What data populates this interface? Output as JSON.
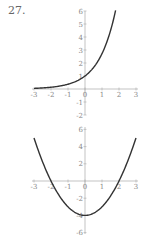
{
  "problem_number": "27.",
  "chart_data": [
    {
      "type": "line",
      "title": "",
      "function": "y = e^x",
      "x": [
        -3,
        -2.5,
        -2,
        -1.5,
        -1,
        -0.5,
        0,
        0.5,
        1,
        1.5,
        1.8
      ],
      "values": [
        0.05,
        0.08,
        0.14,
        0.22,
        0.37,
        0.61,
        1,
        1.65,
        2.72,
        4.48,
        6.05
      ],
      "xlabel": "",
      "ylabel": "",
      "xlim": [
        -3,
        3
      ],
      "ylim": [
        -2,
        6
      ],
      "x_ticks": [
        "-3",
        "-2",
        "-1",
        "0",
        "1",
        "2",
        "3"
      ],
      "y_ticks": [
        "-2",
        "-1",
        "1",
        "2",
        "3",
        "4",
        "5",
        "6"
      ],
      "grid": false
    },
    {
      "type": "line",
      "title": "",
      "function": "y = x^2 - 4",
      "x": [
        -3,
        -2.5,
        -2,
        -1.5,
        -1,
        -0.5,
        0,
        0.5,
        1,
        1.5,
        2,
        2.5,
        3
      ],
      "values": [
        5,
        2.25,
        0,
        -1.75,
        -3,
        -3.75,
        -4,
        -3.75,
        -3,
        -1.75,
        0,
        2.25,
        5
      ],
      "xlabel": "",
      "ylabel": "",
      "xlim": [
        -3,
        3
      ],
      "ylim": [
        -6,
        6
      ],
      "x_ticks": [
        "-3",
        "-2",
        "-1",
        "0",
        "1",
        "2",
        "3"
      ],
      "y_ticks": [
        "-6",
        "-4",
        "-2",
        "2",
        "4",
        "6"
      ],
      "grid": false
    }
  ]
}
